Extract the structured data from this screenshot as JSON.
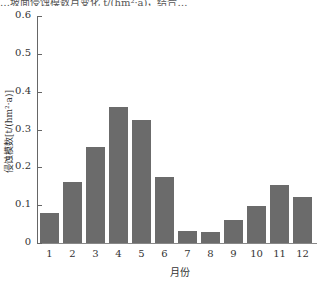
{
  "header": {
    "partial_text": "…坡面侵蚀模数月变化 t/(hm²·a)，结合…"
  },
  "chart_data": {
    "type": "bar",
    "title": "",
    "xlabel": "月份",
    "ylabel": "侵蚀模数[t/(hm²·a)]",
    "categories": [
      "1",
      "2",
      "3",
      "4",
      "5",
      "6",
      "7",
      "8",
      "9",
      "10",
      "11",
      "12"
    ],
    "values": [
      0.078,
      0.16,
      0.253,
      0.36,
      0.325,
      0.175,
      0.033,
      0.03,
      0.06,
      0.098,
      0.153,
      0.122
    ],
    "ylim": [
      0,
      0.6
    ],
    "yticks": [
      "0",
      "0.1",
      "0.2",
      "0.3",
      "0.4",
      "0.5",
      "0.6"
    ],
    "grid": false,
    "bar_color": "#6b6b6b"
  }
}
